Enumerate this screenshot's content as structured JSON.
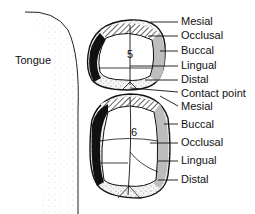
{
  "diagram": {
    "tongue_label": "Tongue",
    "upper_tooth": {
      "number": "5",
      "labels": [
        "Mesial",
        "Occlusal",
        "Buccal",
        "Lingual",
        "Distal"
      ]
    },
    "contact_label": "Contact point",
    "lower_tooth": {
      "number": "6",
      "labels": [
        "Mesial",
        "Buccal",
        "Occlusal",
        "Lingual",
        "Distal"
      ]
    },
    "colors": {
      "outline": "#111111",
      "lingual_fill": "#111111",
      "buccal_fill": "#bdbdbd",
      "stipple": "#888888"
    }
  }
}
